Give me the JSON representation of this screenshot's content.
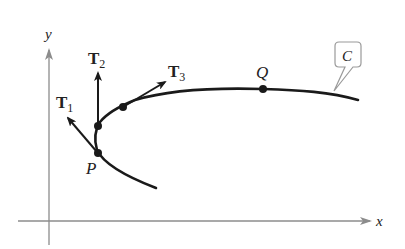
{
  "diagram": {
    "axes": {
      "x_label": "x",
      "y_label": "y",
      "color": "#8c8c8c"
    },
    "curve": {
      "label": "C",
      "color": "#1a1a1a"
    },
    "points": [
      {
        "name": "P",
        "label": "P"
      },
      {
        "name": "Q",
        "label": "Q"
      }
    ],
    "tangent_vectors": [
      {
        "name": "T1",
        "base": "T",
        "sub": "1"
      },
      {
        "name": "T2",
        "base": "T",
        "sub": "2"
      },
      {
        "name": "T3",
        "base": "T",
        "sub": "3"
      }
    ]
  }
}
